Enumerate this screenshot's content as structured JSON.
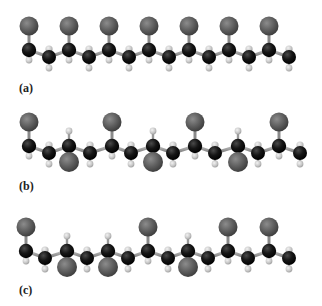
{
  "figure": {
    "colors": {
      "chlorine": "#6a6a6a",
      "carbon": "#1a1a1a",
      "hydrogen": "#d4d4d4",
      "bond": "#9a9a9a",
      "background": "#ffffff"
    },
    "panels": [
      {
        "label": "(a)",
        "name": "isotactic",
        "label_pos": [
          19,
          82
        ],
        "chain_y": 50,
        "ch2_dy": 7,
        "c_x": [
          29,
          69,
          109,
          149,
          189,
          229,
          269
        ],
        "ch2_x": [
          49,
          89,
          129,
          169,
          209,
          249,
          289
        ],
        "cl_side": [
          "up",
          "up",
          "up",
          "up",
          "up",
          "up",
          "up"
        ]
      },
      {
        "label": "(b)",
        "name": "syndiotactic",
        "label_pos": [
          19,
          180
        ],
        "chain_y": 146,
        "ch2_dy": 7,
        "c_x": [
          29,
          69,
          112,
          153,
          195,
          238,
          279
        ],
        "ch2_x": [
          49,
          90,
          131,
          173,
          215,
          258,
          300
        ],
        "cl_side": [
          "up",
          "down",
          "up",
          "down",
          "up",
          "down",
          "up"
        ]
      },
      {
        "label": "(c)",
        "name": "atactic",
        "label_pos": [
          19,
          284
        ],
        "chain_y": 251,
        "ch2_dy": 7,
        "c_x": [
          26,
          67,
          108,
          148,
          188,
          228,
          269
        ],
        "ch2_x": [
          45,
          87,
          128,
          168,
          208,
          248,
          289
        ],
        "cl_side": [
          "up",
          "down",
          "down",
          "up",
          "down",
          "up",
          "up"
        ]
      }
    ]
  }
}
